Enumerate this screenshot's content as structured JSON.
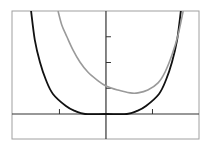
{
  "chart_data": {
    "type": "line",
    "title": "",
    "xlabel": "",
    "ylabel": "",
    "xlim": [
      -2.02,
      2.0
    ],
    "ylim": [
      -0.97,
      4.0
    ],
    "grid": false,
    "legend": null,
    "x_ticks": [
      -1,
      1
    ],
    "y_ticks": [
      1,
      2,
      3
    ],
    "tick_labels_shown": false,
    "series": [
      {
        "name": "black-curve",
        "color": "#111111",
        "points": [
          [
            -1.61,
            4.0
          ],
          [
            -1.53,
            2.88
          ],
          [
            -1.42,
            2.02
          ],
          [
            -1.29,
            1.32
          ],
          [
            -1.14,
            0.78
          ],
          [
            -0.86,
            0.31
          ],
          [
            -0.67,
            0.12
          ],
          [
            -0.45,
            0.0
          ],
          [
            0.0,
            0.0
          ],
          [
            0.45,
            0.0
          ],
          [
            0.67,
            0.12
          ],
          [
            0.86,
            0.31
          ],
          [
            1.14,
            0.78
          ],
          [
            1.29,
            1.32
          ],
          [
            1.42,
            2.02
          ],
          [
            1.53,
            2.88
          ],
          [
            1.61,
            4.0
          ]
        ]
      },
      {
        "name": "gray-curve",
        "color": "#9a9a9a",
        "points": [
          [
            -1.03,
            4.0
          ],
          [
            -0.95,
            3.46
          ],
          [
            -0.84,
            3.0
          ],
          [
            -0.71,
            2.49
          ],
          [
            -0.56,
            2.02
          ],
          [
            -0.39,
            1.63
          ],
          [
            -0.19,
            1.32
          ],
          [
            0.0,
            1.09
          ],
          [
            0.26,
            0.93
          ],
          [
            0.52,
            0.82
          ],
          [
            0.69,
            0.82
          ],
          [
            0.9,
            0.93
          ],
          [
            1.12,
            1.21
          ],
          [
            1.27,
            1.63
          ],
          [
            1.42,
            2.3
          ],
          [
            1.55,
            3.07
          ],
          [
            1.66,
            4.0
          ]
        ]
      }
    ]
  },
  "style": {
    "frame_color": "#a0a0a0",
    "axis_color": "#333333",
    "background": "#ffffff"
  }
}
